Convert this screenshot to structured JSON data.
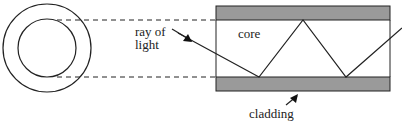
{
  "diagram": {
    "labels": {
      "ray_line1": "ray of",
      "ray_line2": "light",
      "core": "core",
      "cladding": "cladding"
    },
    "colors": {
      "cladding_fill": "#9a9a9a",
      "stroke": "#222222",
      "background": "#ffffff"
    }
  }
}
